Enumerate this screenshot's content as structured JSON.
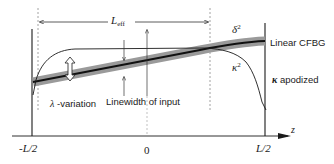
{
  "diagram": {
    "colors": {
      "line": "#1a1a1a",
      "band": "#9a9a9a",
      "dashed": "#8a8a8a",
      "background": "#ffffff"
    },
    "labels": {
      "l_eff_main": "L",
      "l_eff_sub": "eff",
      "delta_main": "δ",
      "delta_sup": "2",
      "kappa_main": "κ",
      "kappa_sup": "2",
      "linear_cfbg": "Linear CFBG",
      "kappa_apodized_sym": "κ",
      "kappa_apodized_text": " apodized",
      "lambda_sym": "λ",
      "lambda_text": " -variation",
      "linewidth": "Linewidth of input",
      "axis_z": "z",
      "tick_left": "-L/2",
      "tick_zero": "0",
      "tick_right": "L/2"
    },
    "axis": {
      "variable": "z",
      "ticks": [
        "-L/2",
        "0",
        "L/2"
      ]
    },
    "curves": [
      {
        "name": "delta-squared",
        "description": "Linear CFBG chirp band, rising linearly from -L/2 to L/2"
      },
      {
        "name": "kappa-squared",
        "description": "Apodized coupling profile, rises near -L/2, flat, falls near L/2"
      }
    ],
    "annotations": [
      {
        "name": "effective-length",
        "text": "L_eff",
        "type": "double-arrow"
      },
      {
        "name": "lambda-variation",
        "text": "λ -variation",
        "type": "hollow double-arrow"
      },
      {
        "name": "linewidth-of-input",
        "text": "Linewidth of input",
        "type": "arrows"
      }
    ]
  }
}
